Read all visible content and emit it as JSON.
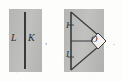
{
  "figure": {
    "caption_none": "",
    "left_diagram": {
      "name": "plane with line",
      "labels": {
        "left_label": "L",
        "right_label": "K"
      },
      "trailing_punctuation": ","
    },
    "right_diagram": {
      "name": "plane with triangle and rhombus",
      "labels": {
        "top_segment_label": "I",
        "bottom_segment_label": "I",
        "rhombus_label": "O"
      },
      "trailing_punctuation": "."
    },
    "colors": {
      "panel_gray": "#b9b9b7",
      "ink": "#2b2b2b",
      "paper": "#fdfdfc",
      "rhombus_fill": "#f4f2ee"
    }
  }
}
